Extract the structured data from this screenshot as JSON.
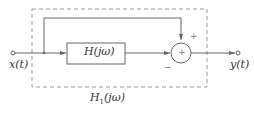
{
  "diagram": {
    "input_label": "x(t)",
    "output_label": "y(t)",
    "block_label": "H(jω)",
    "overall_label_main": "H",
    "overall_label_sub": "1",
    "overall_label_arg": "(jω)",
    "summer_symbol": "+",
    "feedforward_sign": "+",
    "block_path_sign": "−"
  },
  "colors": {
    "line": "#555555",
    "dashed_box": "#999999",
    "text": "#333333"
  }
}
